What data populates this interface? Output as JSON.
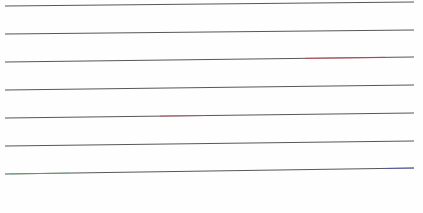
{
  "page": {
    "type": "ruled-paper-scan",
    "width": 423,
    "height": 213,
    "background": "#fefefe"
  },
  "ruled_lines": [
    {
      "x1": 5,
      "y1": 6,
      "x2": 414,
      "y2": 2,
      "color": "#3a3a3a",
      "tint": null
    },
    {
      "x1": 5,
      "y1": 34,
      "x2": 414,
      "y2": 30,
      "color": "#3a3a3a",
      "tint": null
    },
    {
      "x1": 5,
      "y1": 62,
      "x2": 414,
      "y2": 57,
      "color": "#3a3a3a",
      "tint": {
        "from": 305,
        "to": 385,
        "color": "#d04050"
      }
    },
    {
      "x1": 5,
      "y1": 90,
      "x2": 414,
      "y2": 85,
      "color": "#3a3a3a",
      "tint": null
    },
    {
      "x1": 5,
      "y1": 118,
      "x2": 414,
      "y2": 113,
      "color": "#3a3a3a",
      "tint": {
        "from": 160,
        "to": 205,
        "color": "#c05060"
      }
    },
    {
      "x1": 5,
      "y1": 146,
      "x2": 414,
      "y2": 141,
      "color": "#3a3a3a",
      "tint": null
    },
    {
      "x1": 5,
      "y1": 174,
      "x2": 414,
      "y2": 168,
      "color": "#3a3a3a",
      "tint": {
        "from": 10,
        "to": 70,
        "color": "#60c070"
      }
    }
  ],
  "ruled_lines_accent_end": {
    "line_index": 6,
    "from": 385,
    "to": 414,
    "color": "#4050c0"
  },
  "text_content": []
}
